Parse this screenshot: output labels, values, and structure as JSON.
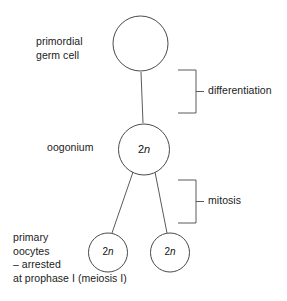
{
  "diagram": {
    "stroke_color": "#4a4a4a",
    "text_color": "#1b1b1b",
    "background_color": "#ffffff",
    "cells": [
      {
        "id": "primordial-germ-cell",
        "label": "primordial\ngerm cell",
        "ploidy": "",
        "cx": 140.5,
        "cy": 43.5,
        "r": 27.5
      },
      {
        "id": "oogonium",
        "label": "oogonium",
        "ploidy": "2n",
        "cx": 144,
        "cy": 149.5,
        "r": 25.5
      },
      {
        "id": "primary-oocyte-left",
        "label": "",
        "ploidy": "2n",
        "cx": 108,
        "cy": 252.5,
        "r": 19.5
      },
      {
        "id": "primary-oocyte-right",
        "label": "",
        "ploidy": "2n",
        "cx": 170,
        "cy": 252.5,
        "r": 19.5
      }
    ],
    "group_label": "primary\noocytes\n– arrested\nat prophase I (meiosis I)",
    "brackets": [
      {
        "id": "differentiation",
        "label": "differentiation",
        "x": 196,
        "y_top": 70,
        "y_bottom": 113,
        "arm_length": 18,
        "tick_length": 8
      },
      {
        "id": "mitosis",
        "label": "mitosis",
        "x": 196,
        "y_top": 180,
        "y_bottom": 223,
        "arm_length": 18,
        "tick_length": 8
      }
    ],
    "connectors": [
      {
        "id": "pgc-to-oogonium",
        "type": "vertical",
        "x1": 141,
        "y1": 72,
        "x2": 143,
        "y2": 123
      },
      {
        "id": "oogonium-to-left-oocyte",
        "type": "diagonal",
        "x1": 133,
        "y1": 172,
        "x2": 112,
        "y2": 233
      },
      {
        "id": "oogonium-to-right-oocyte",
        "type": "diagonal",
        "x1": 155,
        "y1": 172,
        "x2": 167,
        "y2": 233
      }
    ]
  }
}
